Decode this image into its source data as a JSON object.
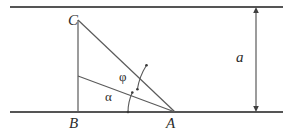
{
  "figure": {
    "background_color": "#ffffff",
    "stroke_color": "#4a4a4a",
    "text_color": "#2b2b2b",
    "labels": {
      "vertex_c": "C",
      "vertex_b": "B",
      "vertex_a": "A",
      "dimension_a": "a",
      "angle_phi": "φ",
      "angle_alpha": "α"
    }
  },
  "geometry": {
    "top_rail": {
      "x1": 10,
      "y1": 7,
      "x2": 283,
      "y2": 7
    },
    "bottom_rail": {
      "x1": 10,
      "y1": 112,
      "x2": 283,
      "y2": 112
    },
    "vertical_cb": {
      "x1": 78,
      "y1": 20,
      "x2": 78,
      "y2": 112
    },
    "hypotenuse_ca": {
      "x1": 78,
      "y1": 20,
      "x2": 175,
      "y2": 112
    },
    "median_line": {
      "x1": 78,
      "y1": 76,
      "x2": 175,
      "y2": 112
    },
    "dimension_line": {
      "x": 256,
      "y1": 7,
      "y2": 112
    },
    "points": {
      "C": {
        "x": 78,
        "y": 20
      },
      "B": {
        "x": 78,
        "y": 112
      },
      "A": {
        "x": 175,
        "y": 112
      }
    },
    "arc_alpha": {
      "center_x": 175,
      "center_y": 112,
      "radius": 47
    },
    "arc_phi": {
      "center_x": 175,
      "center_y": 112,
      "radius": 62
    },
    "dot_markers": [
      {
        "x": 128,
        "y": 112
      },
      {
        "x": 133,
        "y": 95
      },
      {
        "x": 140,
        "y": 88
      },
      {
        "x": 146,
        "y": 65
      }
    ]
  }
}
